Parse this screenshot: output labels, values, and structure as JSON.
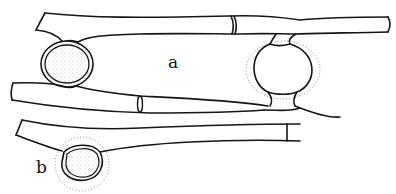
{
  "figure": {
    "labels": {
      "a": "a",
      "b": "b"
    },
    "colors": {
      "line": "#151515",
      "stipple": "#777777",
      "background": "#ffffff"
    }
  }
}
